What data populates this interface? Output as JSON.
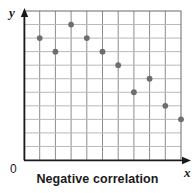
{
  "chart_data": {
    "type": "scatter",
    "title": "Negative correlation",
    "xlabel": "x",
    "ylabel": "y",
    "origin_label": "0",
    "grid": true,
    "grid_columns": 10,
    "grid_rows": 11,
    "xlim": [
      0,
      10
    ],
    "ylim": [
      0,
      11
    ],
    "tick_labels_x": [],
    "tick_labels_y": [],
    "legend": null,
    "series": [
      {
        "name": "data",
        "marker": "circle",
        "color": "#6e6e6e",
        "points": [
          {
            "x": 1,
            "y": 9
          },
          {
            "x": 2,
            "y": 8
          },
          {
            "x": 3,
            "y": 10
          },
          {
            "x": 4,
            "y": 9
          },
          {
            "x": 5,
            "y": 8
          },
          {
            "x": 6,
            "y": 7
          },
          {
            "x": 7,
            "y": 5
          },
          {
            "x": 8,
            "y": 6
          },
          {
            "x": 9,
            "y": 4
          },
          {
            "x": 10,
            "y": 3
          }
        ]
      }
    ],
    "colors": {
      "grid_line": "#8c8c8c",
      "grid_line_light": "#b9b9b9",
      "frame": "#6b6b6b",
      "axis": "#1a1a1a",
      "marker": "#6e6e6e",
      "text": "#1a1a1a",
      "background": "#ffffff"
    }
  },
  "caption": {
    "text": "Negative correlation"
  },
  "axes": {
    "x_label": "x",
    "y_label": "y",
    "origin": "0"
  }
}
